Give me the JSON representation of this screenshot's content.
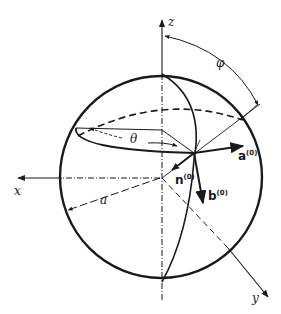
{
  "figure": {
    "type": "sphere-coordinate-diagram",
    "axes": {
      "x": "x",
      "y": "y",
      "z": "z"
    },
    "angles": {
      "theta": "θ",
      "phi": "φ"
    },
    "radius_label": "a",
    "vectors": {
      "a": {
        "base": "a",
        "sup": "(0)"
      },
      "b": {
        "base": "b",
        "sup": "(0)"
      },
      "n": {
        "base": "n",
        "sup": "(0)"
      }
    },
    "colors": {
      "ink": "#1a1a1a",
      "background": "#ffffff"
    }
  }
}
